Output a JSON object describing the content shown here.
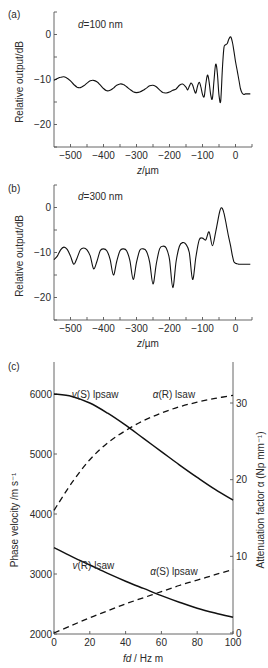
{
  "chart_data": [
    {
      "panel": "(a)",
      "type": "line",
      "annotation": "d=100 nm",
      "xlabel": "z/µm",
      "ylabel": "Relative output/dB",
      "xlim": [
        -550,
        50
      ],
      "ylim": [
        -25,
        5
      ],
      "xticks": [
        -500,
        -400,
        -300,
        -200,
        -100,
        0
      ],
      "xtick_labels": [
        "−500",
        "−400",
        "−300",
        "−200",
        "−100",
        "0"
      ],
      "yticks": [
        0,
        -10,
        -20
      ],
      "ytick_labels": [
        "0",
        "−10",
        "−20"
      ],
      "series": [
        {
          "name": "d=100 nm",
          "x": [
            -550,
            -540,
            -530,
            -520,
            -510,
            -500,
            -490,
            -480,
            -470,
            -460,
            -450,
            -440,
            -430,
            -420,
            -410,
            -400,
            -390,
            -380,
            -370,
            -360,
            -350,
            -340,
            -330,
            -320,
            -310,
            -300,
            -290,
            -280,
            -270,
            -260,
            -250,
            -240,
            -230,
            -220,
            -210,
            -200,
            -190,
            -180,
            -170,
            -160,
            -150,
            -145,
            -140,
            -135,
            -130,
            -125,
            -120,
            -115,
            -110,
            -105,
            -100,
            -95,
            -90,
            -85,
            -80,
            -75,
            -70,
            -65,
            -60,
            -55,
            -50,
            -45,
            -40,
            -35,
            -30,
            -25,
            -20,
            -15,
            -10,
            -5,
            0,
            5,
            10,
            15,
            20,
            25,
            30,
            35,
            40,
            45
          ],
          "y": [
            -10.2,
            -9.8,
            -9.5,
            -9.4,
            -9.7,
            -10.3,
            -11.1,
            -11.7,
            -11.8,
            -11.4,
            -10.8,
            -10.3,
            -10.2,
            -10.5,
            -11.2,
            -12.0,
            -12.5,
            -12.4,
            -11.9,
            -11.3,
            -11.0,
            -11.1,
            -11.6,
            -12.2,
            -12.7,
            -12.9,
            -12.8,
            -12.4,
            -11.9,
            -11.4,
            -11.3,
            -11.6,
            -12.3,
            -12.9,
            -13.0,
            -12.8,
            -12.4,
            -12.1,
            -11.3,
            -11.0,
            -11.7,
            -12.3,
            -11.5,
            -10.8,
            -11.2,
            -12.4,
            -13.0,
            -11.5,
            -10.6,
            -11.6,
            -13.3,
            -13.8,
            -11.0,
            -9.0,
            -10.5,
            -13.5,
            -14.2,
            -10.0,
            -6.6,
            -8.5,
            -13.5,
            -14.8,
            -8.0,
            -3.0,
            -2.3,
            -2.0,
            -1.0,
            -0.5,
            -1.5,
            -3.5,
            -6.0,
            -8.0,
            -10.0,
            -12.0,
            -13.0,
            -13.3,
            -13.2,
            -13.2,
            -13.2,
            -13.2
          ]
        }
      ]
    },
    {
      "panel": "(b)",
      "type": "line",
      "annotation": "d=300 nm",
      "xlabel": "z/µm",
      "ylabel": "Relative output/dB",
      "xlim": [
        -550,
        50
      ],
      "ylim": [
        -25,
        5
      ],
      "xticks": [
        -500,
        -400,
        -300,
        -200,
        -100,
        0
      ],
      "xtick_labels": [
        "−500",
        "−400",
        "−300",
        "−200",
        "−100",
        "0"
      ],
      "yticks": [
        0,
        -10,
        -20
      ],
      "ytick_labels": [
        "0",
        "−10",
        "−20"
      ],
      "series": [
        {
          "name": "d=300 nm",
          "x": [
            -550,
            -540,
            -530,
            -520,
            -510,
            -500,
            -490,
            -480,
            -470,
            -460,
            -450,
            -440,
            -430,
            -420,
            -410,
            -400,
            -390,
            -380,
            -370,
            -360,
            -350,
            -340,
            -330,
            -320,
            -310,
            -300,
            -290,
            -280,
            -270,
            -260,
            -250,
            -240,
            -230,
            -220,
            -210,
            -200,
            -190,
            -180,
            -170,
            -160,
            -150,
            -140,
            -130,
            -120,
            -110,
            -100,
            -90,
            -80,
            -70,
            -60,
            -50,
            -45,
            -40,
            -35,
            -30,
            -25,
            -20,
            -15,
            -10,
            -5,
            0,
            5,
            10,
            15,
            20,
            25,
            30,
            35,
            40,
            45
          ],
          "y": [
            -11.6,
            -10.8,
            -9.4,
            -8.8,
            -9.3,
            -10.8,
            -12.6,
            -11.2,
            -9.4,
            -9.0,
            -9.4,
            -10.8,
            -13.6,
            -12.0,
            -9.6,
            -9.2,
            -9.6,
            -11.5,
            -15.0,
            -12.0,
            -9.6,
            -9.2,
            -9.6,
            -11.8,
            -16.0,
            -12.2,
            -9.5,
            -9.2,
            -9.7,
            -12.2,
            -17.0,
            -12.5,
            -9.2,
            -8.6,
            -9.0,
            -11.5,
            -17.8,
            -12.0,
            -8.6,
            -7.8,
            -8.2,
            -10.0,
            -16.0,
            -11.0,
            -7.2,
            -6.8,
            -7.2,
            -5.4,
            -8.5,
            -5.4,
            -1.6,
            -0.2,
            -0.2,
            -1.2,
            -3.0,
            -5.0,
            -6.8,
            -8.5,
            -10.5,
            -12.0,
            -12.4,
            -12.5,
            -12.6,
            -12.6,
            -12.6,
            -12.6,
            -12.6,
            -12.6,
            -12.6,
            -12.6
          ]
        }
      ]
    },
    {
      "panel": "(c)",
      "type": "line",
      "xlabel": "fd / Hz m",
      "ylabel": "Phase velocity /m s⁻¹",
      "ylabel_right": "Attenuation factor α (Np mm⁻¹)",
      "xlim": [
        0,
        100
      ],
      "ylim": [
        2000,
        6500
      ],
      "ylim_right": [
        0,
        35
      ],
      "xticks": [
        0,
        20,
        40,
        60,
        80,
        100
      ],
      "xtick_labels": [
        "0",
        "20",
        "40",
        "60",
        "80",
        "100"
      ],
      "yticks": [
        2000,
        3000,
        4000,
        5000,
        6000
      ],
      "ytick_labels": [
        "2000",
        "3000",
        "4000",
        "5000",
        "6000"
      ],
      "yticks_right": [
        0,
        10,
        20,
        30
      ],
      "ytick_labels_right": [
        "0",
        "10",
        "20",
        "30"
      ],
      "series": [
        {
          "name": "v(S) lpsaw",
          "axis": "left",
          "style": "solid",
          "x": [
            0,
            10,
            20,
            30,
            40,
            50,
            60,
            70,
            80,
            90,
            100
          ],
          "y": [
            6000,
            5960,
            5850,
            5680,
            5480,
            5260,
            5040,
            4820,
            4610,
            4410,
            4230
          ]
        },
        {
          "name": "α(R) lsaw",
          "axis": "right",
          "style": "dashed",
          "x": [
            0,
            10,
            20,
            30,
            40,
            50,
            60,
            70,
            80,
            90,
            100
          ],
          "y": [
            16,
            19.6,
            22.6,
            24.8,
            26.4,
            27.7,
            28.7,
            29.5,
            30.1,
            30.6,
            31.0
          ]
        },
        {
          "name": "v(R) lsaw",
          "axis": "left",
          "style": "solid",
          "x": [
            0,
            10,
            20,
            30,
            40,
            50,
            60,
            70,
            80,
            90,
            100
          ],
          "y": [
            3440,
            3290,
            3150,
            3010,
            2880,
            2760,
            2640,
            2530,
            2430,
            2350,
            2280
          ]
        },
        {
          "name": "α(S) lpsaw",
          "axis": "right",
          "style": "dashed",
          "x": [
            0,
            10,
            20,
            30,
            40,
            50,
            60,
            70,
            80,
            90,
            100
          ],
          "y": [
            0,
            1.0,
            2.0,
            2.9,
            3.8,
            4.6,
            5.4,
            6.2,
            6.9,
            7.6,
            8.3
          ]
        }
      ],
      "annotations": [
        {
          "text": "v(S) lpsaw",
          "x": 23,
          "y": 6000
        },
        {
          "text": "α(R) lsaw",
          "x": 67,
          "y": 6000
        },
        {
          "text": "v(R) lsaw",
          "x": 22,
          "y": 3150
        },
        {
          "text": "α(S) lpsaw",
          "x": 67,
          "y": 3050
        }
      ]
    }
  ],
  "labels": {
    "panel_a": "(a)",
    "panel_b": "(b)",
    "panel_c": "(c)",
    "annot_a": "d=100 nm",
    "annot_b": "d=300 nm",
    "ylabel_ab": "Relative output/dB",
    "xlabel_ab": "z/µm",
    "ylabel_c_left": "Phase velocity /m s⁻¹",
    "ylabel_c_right": "Attenuation factor α (Np mm⁻¹)",
    "xlabel_c": "fd / Hz m",
    "curve_vS": "v(S) lpsaw",
    "curve_aR": "α(R) lsaw",
    "curve_vR": "v(R) lsaw",
    "curve_aS": "α(S) lpsaw"
  },
  "colors": {
    "line": "#111111",
    "axis": "#555555",
    "text": "#2a2a2a",
    "background": "#ffffff"
  }
}
